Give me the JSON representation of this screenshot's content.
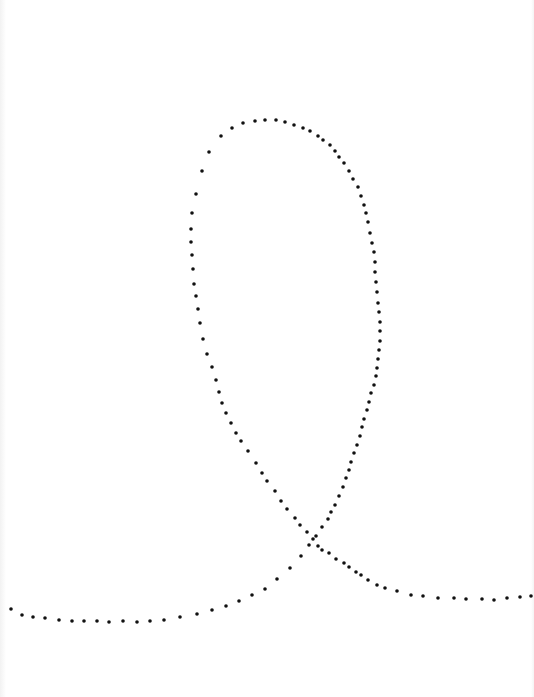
{
  "figure": {
    "background": "#ffffff",
    "dot_color": "#111111",
    "dot_radius": 1.8,
    "dots": [
      [
        11,
        609
      ],
      [
        22,
        615
      ],
      [
        33,
        617
      ],
      [
        45,
        618
      ],
      [
        59,
        620
      ],
      [
        72,
        621
      ],
      [
        84,
        621
      ],
      [
        97,
        621
      ],
      [
        109,
        622
      ],
      [
        123,
        621
      ],
      [
        137,
        622
      ],
      [
        150,
        621
      ],
      [
        164,
        620
      ],
      [
        180,
        617
      ],
      [
        197,
        614
      ],
      [
        212,
        610
      ],
      [
        226,
        606
      ],
      [
        239,
        601
      ],
      [
        252,
        595
      ],
      [
        265,
        589
      ],
      [
        277,
        579
      ],
      [
        290,
        568
      ],
      [
        301,
        556
      ],
      [
        309,
        545
      ],
      [
        316,
        536
      ],
      [
        322,
        527
      ],
      [
        328,
        519
      ],
      [
        331,
        512
      ],
      [
        335,
        505
      ],
      [
        339,
        496
      ],
      [
        343,
        487
      ],
      [
        346,
        478
      ],
      [
        349,
        470
      ],
      [
        351,
        462
      ],
      [
        354,
        453
      ],
      [
        357,
        445
      ],
      [
        360,
        436
      ],
      [
        362,
        427
      ],
      [
        364,
        419
      ],
      [
        367,
        410
      ],
      [
        369,
        402
      ],
      [
        371,
        393
      ],
      [
        374,
        385
      ],
      [
        376,
        376
      ],
      [
        377,
        368
      ],
      [
        378,
        359
      ],
      [
        379,
        350
      ],
      [
        380,
        341
      ],
      [
        380,
        331
      ],
      [
        380,
        322
      ],
      [
        379,
        312
      ],
      [
        378,
        303
      ],
      [
        377,
        292
      ],
      [
        376,
        282
      ],
      [
        375,
        272
      ],
      [
        375,
        262
      ],
      [
        374,
        252
      ],
      [
        372,
        243
      ],
      [
        370,
        233
      ],
      [
        368,
        222
      ],
      [
        366,
        213
      ],
      [
        364,
        205
      ],
      [
        361,
        196
      ],
      [
        358,
        187
      ],
      [
        353,
        179
      ],
      [
        349,
        171
      ],
      [
        344,
        163
      ],
      [
        339,
        157
      ],
      [
        335,
        151
      ],
      [
        330,
        145
      ],
      [
        323,
        140
      ],
      [
        318,
        136
      ],
      [
        310,
        131
      ],
      [
        303,
        128
      ],
      [
        294,
        125
      ],
      [
        285,
        122
      ],
      [
        276,
        120
      ],
      [
        265,
        120
      ],
      [
        255,
        121
      ],
      [
        243,
        123
      ],
      [
        232,
        128
      ],
      [
        221,
        136
      ],
      [
        209,
        152
      ],
      [
        202,
        171
      ],
      [
        196,
        194
      ],
      [
        192,
        213
      ],
      [
        191,
        229
      ],
      [
        191,
        242
      ],
      [
        192,
        255
      ],
      [
        193,
        269
      ],
      [
        194,
        284
      ],
      [
        196,
        296
      ],
      [
        198,
        309
      ],
      [
        200,
        323
      ],
      [
        203,
        339
      ],
      [
        207,
        354
      ],
      [
        212,
        367
      ],
      [
        216,
        380
      ],
      [
        219,
        392
      ],
      [
        222,
        403
      ],
      [
        226,
        413
      ],
      [
        231,
        423
      ],
      [
        236,
        433
      ],
      [
        241,
        441
      ],
      [
        248,
        451
      ],
      [
        256,
        463
      ],
      [
        262,
        473
      ],
      [
        267,
        481
      ],
      [
        275,
        491
      ],
      [
        281,
        501
      ],
      [
        287,
        509
      ],
      [
        295,
        518
      ],
      [
        300,
        525
      ],
      [
        307,
        532
      ],
      [
        313,
        539
      ],
      [
        318,
        546
      ],
      [
        322,
        550
      ],
      [
        329,
        553
      ],
      [
        336,
        559
      ],
      [
        344,
        563
      ],
      [
        349,
        567
      ],
      [
        356,
        572
      ],
      [
        361,
        575
      ],
      [
        368,
        580
      ],
      [
        377,
        585
      ],
      [
        385,
        588
      ],
      [
        397,
        591
      ],
      [
        411,
        595
      ],
      [
        423,
        596
      ],
      [
        438,
        598
      ],
      [
        454,
        598
      ],
      [
        466,
        599
      ],
      [
        482,
        599
      ],
      [
        494,
        600
      ],
      [
        507,
        598
      ],
      [
        520,
        597
      ],
      [
        531,
        596
      ]
    ]
  }
}
